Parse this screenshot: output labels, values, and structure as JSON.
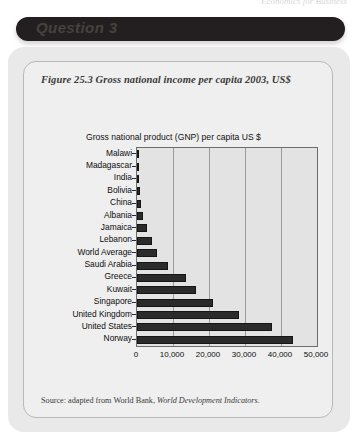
{
  "running_header": {
    "text": "Economics for Business"
  },
  "banner": {
    "label": "Question 3"
  },
  "figure": {
    "caption": "Figure 25.3  Gross national income per capita 2003, US$",
    "source_prefix": "Source:  adapted from World Bank, ",
    "source_italic": "World Development Indicators",
    "source_suffix": "."
  },
  "chart_data": {
    "type": "bar",
    "orientation": "horizontal",
    "title": "Gross national  product (GNP) per capita US $",
    "xlabel": "",
    "ylabel": "",
    "xlim": [
      0,
      50000
    ],
    "xticks": [
      0,
      10000,
      20000,
      30000,
      40000,
      50000
    ],
    "xtick_labels": [
      "0",
      "10,000",
      "20,000",
      "30,000",
      "40,000",
      "50,000"
    ],
    "grid": true,
    "legend": false,
    "bar_color": "#2b2b2b",
    "plot_background": "#e3e3e3",
    "categories": [
      "Malawi",
      "Madagascar",
      "India",
      "Bolivia",
      "China",
      "Albania",
      "Jamaica",
      "Lebanon",
      "World Average",
      "Saudi Arabia",
      "Greece",
      "Kuwait",
      "Singapore",
      "United Kingdom",
      "United States",
      "Norway"
    ],
    "values": [
      170,
      290,
      530,
      890,
      1100,
      1740,
      2760,
      4040,
      5500,
      8530,
      13720,
      16340,
      21230,
      28350,
      37610,
      43350
    ]
  }
}
